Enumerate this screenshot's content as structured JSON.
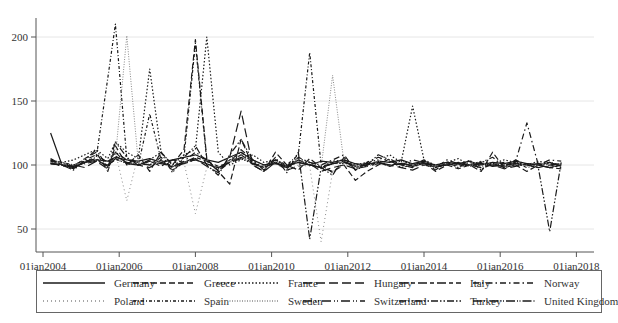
{
  "chart_data": {
    "type": "line",
    "title": "",
    "xlabel": "",
    "ylabel": "",
    "xlim": [
      2004.0,
      2018.0
    ],
    "ylim": [
      40,
      215
    ],
    "grid": true,
    "legend_position": "bottom",
    "x_ticks": [
      2004,
      2006,
      2008,
      2010,
      2012,
      2014,
      2016,
      2018
    ],
    "x_tick_labels": [
      "01jan2004",
      "01jan2006",
      "01jan2008",
      "01jan2010",
      "01jan2012",
      "01jan2014",
      "01jan2016",
      "01jan2018"
    ],
    "y_ticks": [
      50,
      100,
      150,
      200
    ],
    "y_tick_labels": [
      "50",
      "100",
      "150",
      "200"
    ],
    "x": [
      2004.2,
      2004.5,
      2004.8,
      2005.1,
      2005.4,
      2005.7,
      2005.9,
      2006.2,
      2006.5,
      2006.8,
      2007.1,
      2007.4,
      2007.7,
      2008.0,
      2008.3,
      2008.6,
      2008.9,
      2009.2,
      2009.5,
      2009.8,
      2010.1,
      2010.4,
      2010.7,
      2011.0,
      2011.3,
      2011.6,
      2011.9,
      2012.2,
      2012.5,
      2012.8,
      2013.1,
      2013.4,
      2013.7,
      2014.0,
      2014.3,
      2014.6,
      2014.9,
      2015.2,
      2015.5,
      2015.8,
      2016.1,
      2016.4,
      2016.7,
      2017.0,
      2017.3,
      2017.6
    ],
    "series": [
      {
        "name": "Germany",
        "style": "solid",
        "values": [
          125,
          100,
          98,
          102,
          104,
          103,
          106,
          104,
          103,
          105,
          102,
          104,
          106,
          108,
          104,
          102,
          106,
          110,
          104,
          100,
          102,
          98,
          104,
          100,
          103,
          102,
          104,
          101,
          100,
          103,
          102,
          104,
          101,
          103,
          100,
          102,
          101,
          103,
          100,
          102,
          101,
          103,
          101,
          100,
          102,
          99
        ]
      },
      {
        "name": "Greece",
        "style": "dashed",
        "values": [
          104,
          100,
          99,
          105,
          110,
          95,
          115,
          100,
          108,
          95,
          110,
          100,
          112,
          198,
          105,
          95,
          85,
          120,
          100,
          95,
          110,
          100,
          96,
          105,
          98,
          95,
          100,
          88,
          95,
          100,
          105,
          100,
          98,
          102,
          95,
          100,
          97,
          100,
          95,
          110,
          98,
          100,
          95,
          100,
          98,
          97
        ]
      },
      {
        "name": "France",
        "style": "dotted",
        "values": [
          103,
          102,
          104,
          108,
          112,
          105,
          118,
          110,
          105,
          175,
          110,
          100,
          108,
          112,
          200,
          110,
          100,
          104,
          108,
          102,
          104,
          100,
          105,
          102,
          98,
          103,
          104,
          100,
          102,
          104,
          108,
          102,
          146,
          104,
          100,
          102,
          105,
          100,
          103,
          101,
          104,
          102,
          100,
          103,
          101,
          100
        ]
      },
      {
        "name": "Hungary",
        "style": "long-dash",
        "values": [
          102,
          99,
          100,
          98,
          103,
          97,
          110,
          101,
          100,
          98,
          104,
          96,
          102,
          105,
          99,
          94,
          106,
          142,
          100,
          95,
          102,
          96,
          99,
          101,
          95,
          98,
          100,
          97,
          99,
          101,
          100,
          98,
          96,
          100,
          98,
          101,
          99,
          100,
          98,
          100,
          97,
          99,
          101,
          98,
          100,
          98
        ]
      },
      {
        "name": "Italy",
        "style": "long-dash-short-dash",
        "values": [
          101,
          100,
          97,
          103,
          105,
          99,
          107,
          102,
          100,
          103,
          99,
          104,
          102,
          106,
          103,
          99,
          102,
          108,
          101,
          98,
          104,
          99,
          102,
          100,
          98,
          101,
          103,
          99,
          100,
          102,
          99,
          101,
          100,
          102,
          99,
          100,
          102,
          99,
          101,
          100,
          102,
          99,
          101,
          100,
          98,
          100
        ]
      },
      {
        "name": "Norway",
        "style": "dash-dot",
        "values": [
          103,
          101,
          100,
          104,
          108,
          102,
          110,
          104,
          102,
          100,
          106,
          98,
          103,
          110,
          104,
          95,
          102,
          112,
          104,
          100,
          102,
          97,
          106,
          102,
          100,
          104,
          108,
          96,
          102,
          106,
          103,
          100,
          104,
          102,
          98,
          104,
          101,
          100,
          102,
          106,
          99,
          102,
          133,
          100,
          104,
          103
        ]
      },
      {
        "name": "Poland",
        "style": "sparse-dot",
        "values": [
          102,
          100,
          99,
          105,
          108,
          95,
          110,
          72,
          108,
          100,
          104,
          96,
          102,
          62,
          98,
          96,
          104,
          108,
          100,
          97,
          101,
          96,
          100,
          99,
          40,
          95,
          100,
          98,
          99,
          101,
          100,
          102,
          99,
          100,
          98,
          101,
          100,
          99,
          101,
          100,
          98,
          100,
          99,
          101,
          100,
          99
        ]
      },
      {
        "name": "Spain",
        "style": "dot-dash",
        "values": [
          104,
          102,
          100,
          103,
          106,
          168,
          210,
          105,
          100,
          140,
          104,
          98,
          106,
          195,
          103,
          96,
          104,
          110,
          102,
          98,
          104,
          100,
          108,
          188,
          100,
          94,
          102,
          98,
          100,
          102,
          99,
          104,
          100,
          102,
          98,
          101,
          100,
          102,
          99,
          101,
          100,
          102,
          98,
          100,
          102,
          100
        ]
      },
      {
        "name": "Sweden",
        "style": "fine-dot",
        "values": [
          102,
          101,
          100,
          102,
          104,
          100,
          106,
          201,
          102,
          100,
          103,
          99,
          102,
          104,
          101,
          98,
          103,
          106,
          101,
          99,
          102,
          100,
          103,
          101,
          98,
          170,
          102,
          99,
          101,
          103,
          100,
          102,
          100,
          101,
          99,
          101,
          100,
          102,
          100,
          101,
          99,
          101,
          100,
          102,
          100,
          101
        ]
      },
      {
        "name": "Switzerland",
        "style": "long-dash-dot-dot",
        "values": [
          101,
          100,
          99,
          101,
          103,
          100,
          104,
          102,
          101,
          100,
          102,
          99,
          101,
          104,
          101,
          98,
          102,
          105,
          101,
          99,
          101,
          100,
          102,
          100,
          99,
          101,
          102,
          100,
          101,
          102,
          100,
          101,
          100,
          101,
          99,
          100,
          101,
          100,
          101,
          100,
          99,
          101,
          100,
          101,
          100,
          101
        ]
      },
      {
        "name": "Turkey",
        "style": "dash-dot-dot",
        "values": [
          105,
          100,
          96,
          104,
          112,
          98,
          118,
          106,
          100,
          104,
          110,
          94,
          106,
          115,
          100,
          92,
          108,
          120,
          104,
          96,
          106,
          94,
          110,
          42,
          98,
          92,
          106,
          96,
          100,
          108,
          104,
          98,
          100,
          104,
          96,
          102,
          98,
          104,
          96,
          102,
          98,
          104,
          100,
          98,
          48,
          102
        ]
      },
      {
        "name": "United Kingdom",
        "style": "long-dash-dot-dot-fine",
        "values": [
          101,
          100,
          99,
          102,
          104,
          99,
          105,
          101,
          100,
          103,
          101,
          99,
          102,
          104,
          101,
          97,
          102,
          106,
          101,
          98,
          102,
          99,
          102,
          100,
          98,
          101,
          102,
          99,
          100,
          102,
          100,
          101,
          99,
          101,
          100,
          100,
          101,
          100,
          101,
          99,
          100,
          101,
          100,
          100,
          98,
          100
        ]
      }
    ]
  },
  "legend": {
    "items": [
      {
        "label": "Germany"
      },
      {
        "label": "Greece"
      },
      {
        "label": "France"
      },
      {
        "label": "Hungary"
      },
      {
        "label": "Italy"
      },
      {
        "label": "Norway"
      },
      {
        "label": "Poland"
      },
      {
        "label": "Spain"
      },
      {
        "label": "Sweden"
      },
      {
        "label": "Switzerland"
      },
      {
        "label": "Turkey"
      },
      {
        "label": "United Kingdom"
      }
    ]
  },
  "colors": {
    "line": "#1a1a1a",
    "light_line": "#8a8a8a",
    "axis": "#555555",
    "grid": "#e6e6e6",
    "text": "#333333"
  }
}
